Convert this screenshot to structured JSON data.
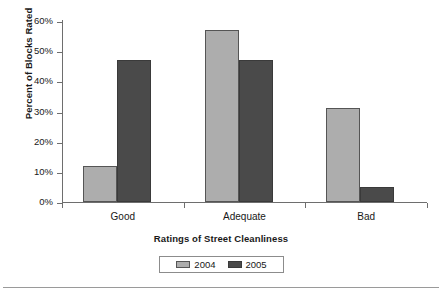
{
  "chart_data": {
    "type": "bar",
    "title": "",
    "xlabel": "Ratings of Street Cleanliness",
    "ylabel": "Percent of Blocks Rated",
    "categories": [
      "Good",
      "Adequate",
      "Bad"
    ],
    "series": [
      {
        "name": "2004",
        "color": "#adadad",
        "values": [
          12,
          57,
          31
        ]
      },
      {
        "name": "2005",
        "color": "#4a4a4a",
        "values": [
          47,
          47,
          5
        ]
      }
    ],
    "ylim": [
      0,
      60
    ],
    "ytick_values": [
      0,
      10,
      20,
      30,
      40,
      50,
      60
    ],
    "ytick_labels": [
      "0%",
      "10%",
      "20%",
      "30%",
      "40%",
      "50%",
      "60%"
    ],
    "grid": false,
    "legend_position": "bottom",
    "value_suffix": "%"
  }
}
